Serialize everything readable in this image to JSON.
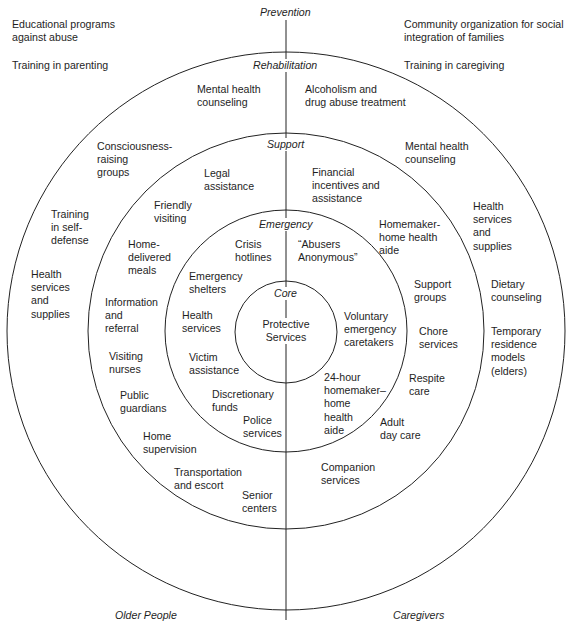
{
  "diagram": {
    "rings": {
      "prevention": "Prevention",
      "rehabilitation": "Rehabilitation",
      "support": "Support",
      "emergency": "Emergency",
      "core": "Core"
    },
    "core_text": "Protective\nServices",
    "sides": {
      "left": "Older People",
      "right": "Caregivers"
    },
    "prevention": {
      "older_people": [
        "Educational programs\nagainst abuse",
        "Training in parenting"
      ],
      "caregivers": [
        "Community organization for social\nintegration of families",
        "Training in caregiving"
      ]
    },
    "rehabilitation": {
      "older_people": [
        "Mental health\ncounseling",
        "Consciousness-\nraising\ngroups",
        "Training\nin self-\ndefense",
        "Health\nservices\nand\nsupplies"
      ],
      "caregivers": [
        "Alcoholism and\ndrug abuse treatment",
        "Mental health\ncounseling",
        "Health\nservices\nand\nsupplies",
        "Dietary\ncounseling",
        "Temporary\nresidence\nmodels\n(elders)"
      ]
    },
    "support": {
      "older_people": [
        "Legal\nassistance",
        "Friendly\nvisiting",
        "Home-\ndelivered\nmeals",
        "Information\nand\nreferral",
        "Visiting\nnurses",
        "Public\nguardians",
        "Home\nsupervision",
        "Transportation\nand escort",
        "Senior\ncenters"
      ],
      "caregivers": [
        "Financial\nincentives and\nassistance",
        "Homemaker-\nhome health\naide",
        "Support\ngroups",
        "Chore\nservices",
        "Respite\ncare",
        "Adult\nday care",
        "Companion\nservices"
      ]
    },
    "emergency": {
      "older_people": [
        "Crisis\nhotlines",
        "Emergency\nshelters",
        "Health\nservices",
        "Victim\nassistance",
        "Discretionary\nfunds",
        "Police\nservices"
      ],
      "caregivers": [
        "“Abusers\nAnonymous”",
        "Voluntary\nemergency\ncaretakers",
        "24-hour\nhomemaker–\nhome\nhealth\naide"
      ]
    }
  }
}
